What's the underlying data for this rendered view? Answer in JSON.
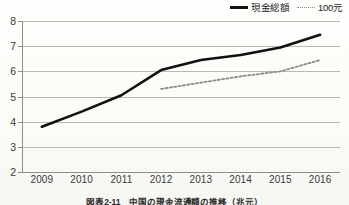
{
  "chart_data": {
    "type": "line",
    "title": "",
    "caption": "図表2-11　中国の現金流通額の推移（兆元）",
    "xlabel": "",
    "ylabel": "",
    "x": [
      "2009",
      "2010",
      "2011",
      "2012",
      "2013",
      "2014",
      "2015",
      "2016"
    ],
    "ylim": [
      2,
      8
    ],
    "yticks": [
      "2",
      "3",
      "4",
      "5",
      "6",
      "7",
      "8"
    ],
    "grid": true,
    "legend_position": "top-right",
    "series": [
      {
        "name": "現金総額",
        "style": "solid",
        "color": "#111111",
        "values": [
          3.8,
          4.4,
          5.05,
          6.05,
          6.45,
          6.65,
          6.95,
          7.45
        ]
      },
      {
        "name": "100元",
        "style": "dotted",
        "color": "#8a8a8a",
        "values": [
          null,
          null,
          null,
          5.3,
          5.55,
          5.8,
          6.0,
          6.45
        ]
      }
    ]
  }
}
